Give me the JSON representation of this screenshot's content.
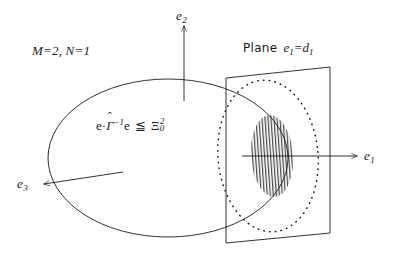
{
  "figure": {
    "name": "ellipsoid-plane-intersection-diagram",
    "background_color": "#ffffff",
    "stroke_color": "#1a1a1a",
    "annotations": {
      "parameters": "M=2,  N=1",
      "plane_word": "Plane",
      "plane_equation": "e",
      "plane_equation_sub1": "1",
      "plane_equation_mid": "=d",
      "plane_equation_sub2": "1",
      "inequality_lhs_e1": "e",
      "inequality_dot": "·",
      "inequality_gamma": "Γ",
      "inequality_hat": "ˆ",
      "inequality_exponent": "−1",
      "inequality_lhs_e2": "e",
      "inequality_relation": "≦",
      "inequality_xi": "Ξ",
      "inequality_xi_sup": "2",
      "inequality_xi_sub": "0"
    },
    "axes": [
      {
        "name": "e1",
        "label": "e",
        "subscript": "1",
        "direction": "right"
      },
      {
        "name": "e2",
        "label": "e",
        "subscript": "2",
        "direction": "up"
      },
      {
        "name": "e3",
        "label": "e",
        "subscript": "3",
        "direction": "down-left"
      }
    ],
    "shapes": {
      "ellipsoid": {
        "type": "ellipse-outline",
        "style": "solid"
      },
      "cutting_plane": {
        "type": "parallelogram",
        "style": "solid"
      },
      "intersection_curve": {
        "type": "ellipse-outline",
        "style": "dotted"
      },
      "cross_section": {
        "type": "ellipse-filled",
        "style": "vertical-hatch"
      }
    }
  }
}
